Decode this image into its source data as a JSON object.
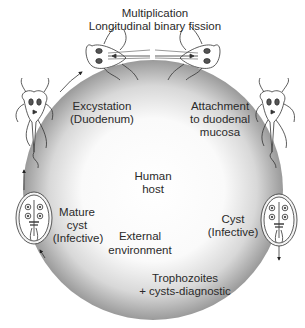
{
  "labels": {
    "multiplication_line1": "Multiplication",
    "multiplication_line2": "Longitudinal binary fission",
    "excystation_line1": "Excystation",
    "excystation_line2": "(Duodenum)",
    "attachment_line1": "Attachment",
    "attachment_line2": "to duodenal",
    "attachment_line3": "mucosa",
    "human_host_line1": "Human",
    "human_host_line2": "host",
    "mature_cyst_line1": "Mature",
    "mature_cyst_line2": "cyst",
    "mature_cyst_line3": "(Infective)",
    "external_line1": "External",
    "external_line2": "environment",
    "cyst_line1": "Cyst",
    "cyst_line2": "(Infective)",
    "tropho_line1": "Trophozoites",
    "tropho_line2": "+ cysts-diagnostic"
  },
  "colors": {
    "circle_edge": "#8a8a8a",
    "circle_center": "#ffffff",
    "line": "#333333"
  },
  "stages": [
    {
      "name": "dividing-trophozoites",
      "position": "top"
    },
    {
      "name": "attached-trophozoite",
      "position": "right"
    },
    {
      "name": "cyst",
      "position": "lower-right"
    },
    {
      "name": "mature-cyst",
      "position": "lower-left"
    },
    {
      "name": "excysted-trophozoite",
      "position": "left"
    }
  ]
}
